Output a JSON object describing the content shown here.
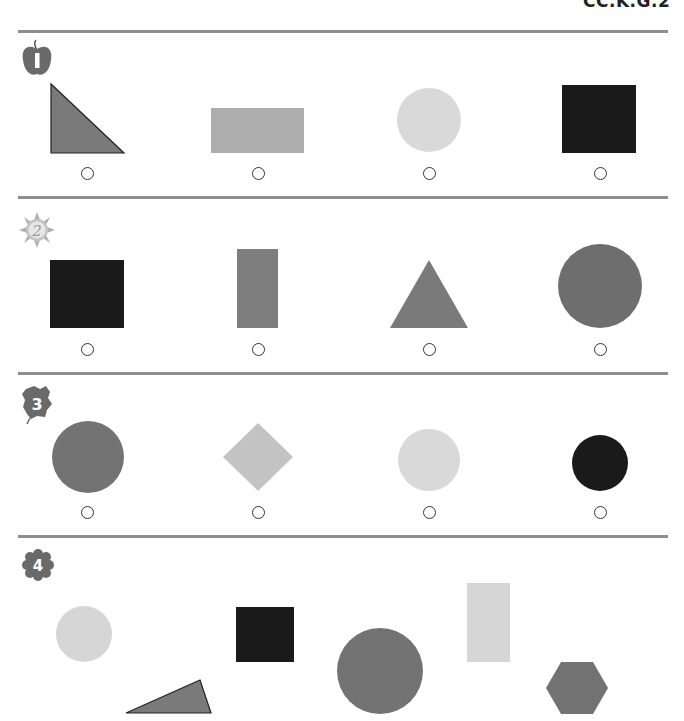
{
  "header": {
    "standard_code": "CC.K.G.2"
  },
  "colors": {
    "divider": "#8e8e8e",
    "mid_gray": "#7a7a7a",
    "light_gray": "#adadad",
    "pale_gray": "#d9d9d9",
    "black": "#1a1a1a",
    "radio_border": "#333333"
  },
  "questions": [
    {
      "number": "1",
      "badge_icon": "apple-icon",
      "options": [
        {
          "shape": "right-triangle",
          "color": "mid_gray",
          "label": ""
        },
        {
          "shape": "rectangle",
          "color": "light_gray",
          "label": ""
        },
        {
          "shape": "circle",
          "color": "pale_gray",
          "label": ""
        },
        {
          "shape": "square",
          "color": "black",
          "label": ""
        }
      ]
    },
    {
      "number": "2",
      "badge_icon": "sun-icon",
      "options": [
        {
          "shape": "square",
          "color": "black",
          "label": ""
        },
        {
          "shape": "rectangle",
          "color": "mid_gray",
          "label": ""
        },
        {
          "shape": "triangle",
          "color": "mid_gray",
          "label": ""
        },
        {
          "shape": "circle",
          "color": "mid_gray",
          "label": ""
        }
      ]
    },
    {
      "number": "3",
      "badge_icon": "leaf-icon",
      "options": [
        {
          "shape": "circle",
          "color": "mid_gray",
          "label": ""
        },
        {
          "shape": "diamond",
          "color": "pale_gray",
          "label": ""
        },
        {
          "shape": "circle",
          "color": "pale_gray",
          "label": ""
        },
        {
          "shape": "circle",
          "color": "black",
          "label": ""
        }
      ]
    },
    {
      "number": "4",
      "badge_icon": "flower-icon",
      "shapes": [
        {
          "shape": "circle",
          "color": "pale_gray"
        },
        {
          "shape": "triangle",
          "color": "mid_gray"
        },
        {
          "shape": "square",
          "color": "black"
        },
        {
          "shape": "circle",
          "color": "mid_gray"
        },
        {
          "shape": "rectangle",
          "color": "pale_gray"
        },
        {
          "shape": "hexagon",
          "color": "mid_gray"
        }
      ]
    }
  ]
}
